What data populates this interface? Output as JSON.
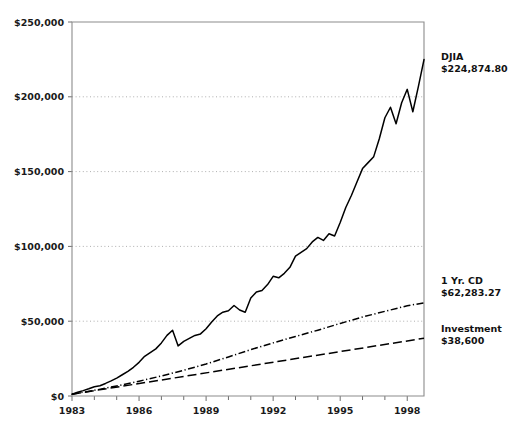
{
  "chart_data": {
    "type": "line",
    "title": "",
    "subtitle": "",
    "xlabel": "",
    "ylabel": "",
    "grid": true,
    "legend_position": "right-annotations",
    "xlim": [
      1983,
      1998.75
    ],
    "ylim": [
      0,
      250000
    ],
    "x_ticks_major": [
      "1983",
      "1986",
      "1989",
      "1992",
      "1995",
      "1998"
    ],
    "x_ticks_major_values": [
      1983,
      1986,
      1989,
      1992,
      1995,
      1998
    ],
    "x_ticks_minor_values": [
      1984,
      1985,
      1987,
      1988,
      1990,
      1991,
      1993,
      1994,
      1996,
      1997
    ],
    "y_ticks": [
      "$0",
      "$50,000",
      "$100,000",
      "$150,000",
      "$200,000",
      "$250,000"
    ],
    "y_tick_values": [
      0,
      50000,
      100000,
      150000,
      200000,
      250000
    ],
    "series": [
      {
        "name": "DJIA",
        "end_label": "DJIA",
        "end_value_label": "$224,874.80",
        "end_value": 224874.8,
        "style": "solid",
        "x": [
          1983.0,
          1983.25,
          1983.5,
          1983.75,
          1984.0,
          1984.25,
          1984.5,
          1984.75,
          1985.0,
          1985.25,
          1985.5,
          1985.75,
          1986.0,
          1986.25,
          1986.5,
          1986.75,
          1987.0,
          1987.25,
          1987.5,
          1987.75,
          1988.0,
          1988.25,
          1988.5,
          1988.75,
          1989.0,
          1989.25,
          1989.5,
          1989.75,
          1990.0,
          1990.25,
          1990.5,
          1990.75,
          1991.0,
          1991.25,
          1991.5,
          1991.75,
          1992.0,
          1992.25,
          1992.5,
          1992.75,
          1993.0,
          1993.25,
          1993.5,
          1993.75,
          1994.0,
          1994.25,
          1994.5,
          1994.75,
          1995.0,
          1995.25,
          1995.5,
          1995.75,
          1996.0,
          1996.25,
          1996.5,
          1996.75,
          1997.0,
          1997.25,
          1997.5,
          1997.75,
          1998.0,
          1998.25,
          1998.5,
          1998.75
        ],
        "values": [
          1200,
          2500,
          3600,
          4800,
          6200,
          6900,
          8400,
          10100,
          12000,
          14200,
          16500,
          19200,
          22500,
          26500,
          29000,
          31500,
          35500,
          40500,
          44000,
          33500,
          36500,
          38500,
          40500,
          41500,
          45000,
          49500,
          53500,
          56000,
          57000,
          60500,
          57500,
          56000,
          65500,
          69500,
          70500,
          74500,
          80000,
          79000,
          82000,
          86000,
          93500,
          96000,
          98500,
          103000,
          106000,
          104000,
          108500,
          107000,
          116000,
          126000,
          134000,
          143000,
          152000,
          156000,
          160000,
          172000,
          186000,
          193000,
          182000,
          196000,
          205000,
          190000,
          207000,
          224874.8
        ]
      },
      {
        "name": "1 Yr. CD",
        "end_label": "1 Yr. CD",
        "end_value_label": "$62,283.27",
        "end_value": 62283.27,
        "style": "dash-dot",
        "x": [
          1983,
          1984,
          1985,
          1986,
          1987,
          1988,
          1989,
          1990,
          1991,
          1992,
          1993,
          1994,
          1995,
          1996,
          1997,
          1998,
          1998.75
        ],
        "values": [
          1200,
          3800,
          6700,
          9900,
          13400,
          17200,
          21400,
          26100,
          31000,
          35500,
          39800,
          44000,
          48500,
          52800,
          56600,
          60300,
          62283.27
        ]
      },
      {
        "name": "Investment",
        "end_label": "Investment",
        "end_value_label": "$38,600",
        "end_value": 38600,
        "style": "long-dash",
        "x": [
          1983,
          1998.75
        ],
        "values": [
          1200,
          38600
        ]
      }
    ]
  },
  "annotations": [
    {
      "name": "DJIA",
      "value": "$224,874.80"
    },
    {
      "name": "1 Yr. CD",
      "value": "$62,283.27"
    },
    {
      "name": "Investment",
      "value": "$38,600"
    }
  ]
}
